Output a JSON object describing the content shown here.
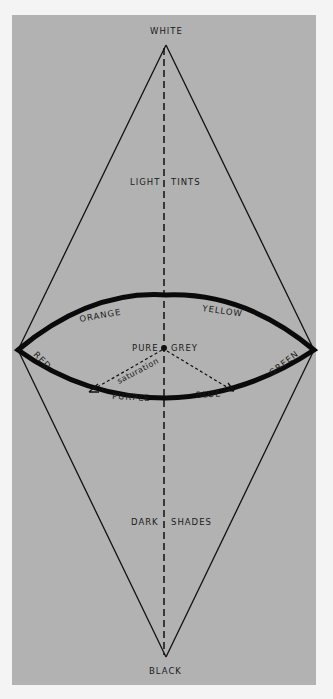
{
  "diagram": {
    "type": "color-solid double cone",
    "labels": {
      "top": "WHITE",
      "bottom": "BLACK",
      "upper_left": "LIGHT",
      "upper_right": "TINTS",
      "lower_left": "DARK",
      "lower_right": "SHADES",
      "center_left": "PURE",
      "center_right": "GREY",
      "hue_orange": "ORANGE",
      "hue_yellow": "YELLOW",
      "hue_red": "RED",
      "hue_green": "GREEN",
      "hue_purple": "PURPLE",
      "hue_blue": "BLUE",
      "saturation": "saturation"
    },
    "colors": {
      "background": "#b2b2b2",
      "page": "#f4f4f4",
      "ink": "#111111"
    }
  }
}
